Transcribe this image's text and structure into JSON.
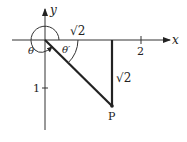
{
  "diagram": {
    "axes": {
      "x_label": "x",
      "y_label": "y",
      "x_tick_label": "2",
      "y_tick_label": "1"
    },
    "angles": {
      "theta": "θ",
      "theta_ref": "θ′"
    },
    "segments": {
      "horizontal_length": "√2",
      "vertical_length": "√2"
    },
    "point": {
      "label": "P"
    },
    "colors": {
      "ink": "#222222",
      "background": "#ffffff"
    }
  }
}
